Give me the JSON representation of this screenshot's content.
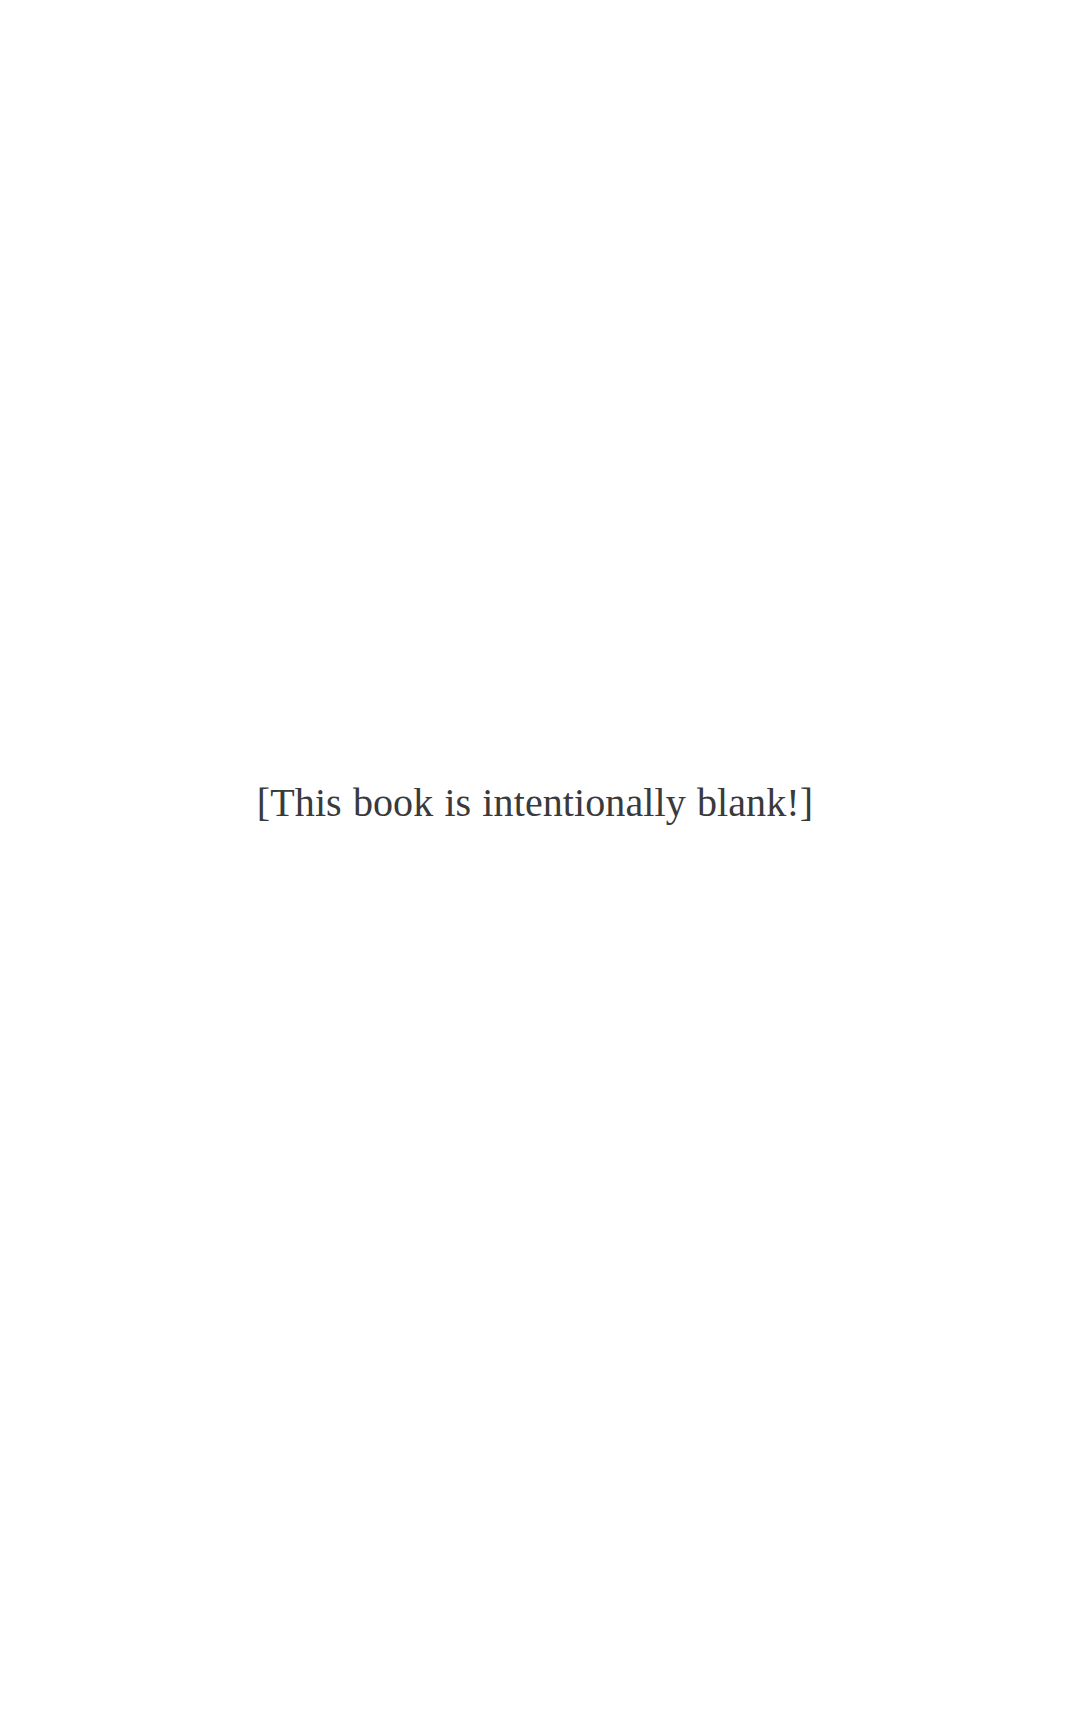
{
  "page": {
    "background_color": "#ffffff",
    "width": 1070,
    "height": 1723,
    "header_text": "",
    "footer_text": "",
    "page_number": ""
  },
  "content": {
    "notice": "[This book is intentionally blank!]",
    "notice_color": "#3a3a3c"
  }
}
